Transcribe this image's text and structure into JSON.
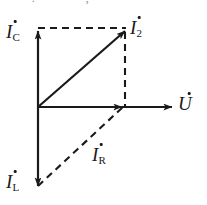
{
  "figure": {
    "kind": "phasor-diagram",
    "background_color": "#ffffff",
    "stroke_color": "#1a1a1a",
    "partial_text_above": "*^ **.**** * *, **",
    "origin": {
      "x": 38,
      "y": 107
    },
    "labels": {
      "ic": {
        "base": "I",
        "sub": "C",
        "dot": true,
        "x": 6,
        "y": 22
      },
      "i2": {
        "base": "I",
        "sub": "2",
        "dot": true,
        "x": 130,
        "y": 18
      },
      "u": {
        "base": "U",
        "sub": "",
        "dot": true,
        "x": 178,
        "y": 95
      },
      "ir": {
        "base": "I",
        "sub": "R",
        "dot": true,
        "x": 92,
        "y": 145
      },
      "il": {
        "base": "I",
        "sub": "L",
        "dot": true,
        "x": 6,
        "y": 172
      }
    },
    "vectors": [
      {
        "name": "u-axis",
        "style": "solid",
        "arrow": true,
        "x1": 38,
        "y1": 107,
        "x2": 172,
        "y2": 107
      },
      {
        "name": "ic-axis",
        "style": "solid",
        "arrow": true,
        "x1": 38,
        "y1": 107,
        "x2": 38,
        "y2": 31
      },
      {
        "name": "il-axis",
        "style": "solid",
        "arrow": true,
        "x1": 38,
        "y1": 107,
        "x2": 38,
        "y2": 186
      },
      {
        "name": "i2",
        "style": "solid",
        "arrow": true,
        "x1": 38,
        "y1": 107,
        "x2": 125,
        "y2": 31
      },
      {
        "name": "i-active",
        "style": "solid",
        "arrow": true,
        "x1": 38,
        "y1": 107,
        "x2": 122,
        "y2": 107
      },
      {
        "name": "ir",
        "style": "dashed",
        "arrow": false,
        "x1": 38,
        "y1": 186,
        "x2": 124,
        "y2": 106
      },
      {
        "name": "proj-top",
        "style": "dashed",
        "arrow": false,
        "x1": 38,
        "y1": 28,
        "x2": 126,
        "y2": 28
      },
      {
        "name": "proj-right",
        "style": "dashed",
        "arrow": false,
        "x1": 125,
        "y1": 32,
        "x2": 125,
        "y2": 107
      }
    ]
  }
}
